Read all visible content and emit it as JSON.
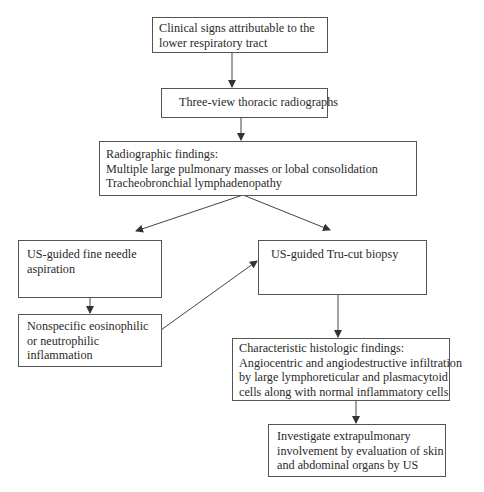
{
  "diagram": {
    "type": "flowchart",
    "nodes": [
      {
        "id": "clinical_signs",
        "lines": [
          "Clinical signs attributable to the",
          "lower respiratory tract"
        ]
      },
      {
        "id": "radiographs",
        "lines": [
          "Three-view thoracic radiographs"
        ]
      },
      {
        "id": "radiographic_findings",
        "lines": [
          "Radiographic findings:",
          "Multiple large pulmonary masses or lobal consolidation",
          "Tracheobronchial lymphadenopathy"
        ]
      },
      {
        "id": "fna",
        "lines": [
          "US-guided fine needle",
          "aspiration"
        ]
      },
      {
        "id": "nonspecific",
        "lines": [
          "Nonspecific eosinophilic",
          "or neutrophilic",
          "inflammation"
        ]
      },
      {
        "id": "trucut",
        "lines": [
          "US-guided Tru-cut biopsy"
        ]
      },
      {
        "id": "histologic",
        "lines": [
          "Characteristic histologic findings:",
          "Angiocentric and angiodestructive infiltration",
          "by large lymphoreticular and plasmacytoid",
          "cells along with normal inflammatory cells"
        ]
      },
      {
        "id": "investigate",
        "lines": [
          "Investigate extrapulmonary",
          "involvement by evaluation of skin",
          "and abdominal organs by US"
        ]
      }
    ],
    "edges": [
      {
        "from": "clinical_signs",
        "to": "radiographs"
      },
      {
        "from": "radiographs",
        "to": "radiographic_findings"
      },
      {
        "from": "radiographic_findings",
        "to": "fna"
      },
      {
        "from": "radiographic_findings",
        "to": "trucut"
      },
      {
        "from": "fna",
        "to": "nonspecific"
      },
      {
        "from": "nonspecific",
        "to": "trucut"
      },
      {
        "from": "trucut",
        "to": "histologic"
      },
      {
        "from": "histologic",
        "to": "investigate"
      }
    ]
  }
}
